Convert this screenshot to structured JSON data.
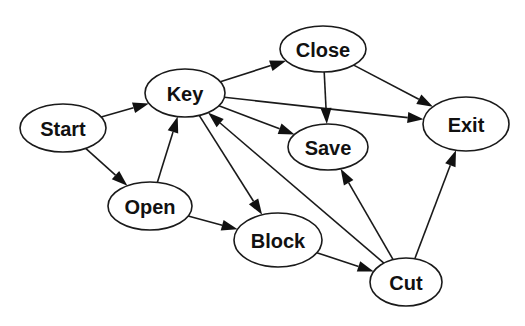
{
  "diagram": {
    "type": "directed-graph",
    "colors": {
      "background": "#ffffff",
      "stroke": "#1a1a1a",
      "text": "#111111"
    },
    "nodes": [
      {
        "id": "start",
        "label": "Start",
        "cx": 63,
        "cy": 128,
        "rx": 43,
        "ry": 24
      },
      {
        "id": "key",
        "label": "Key",
        "cx": 185,
        "cy": 93,
        "rx": 40,
        "ry": 24
      },
      {
        "id": "close",
        "label": "Close",
        "cx": 323,
        "cy": 49,
        "rx": 43,
        "ry": 23
      },
      {
        "id": "save",
        "label": "Save",
        "cx": 328,
        "cy": 147,
        "rx": 40,
        "ry": 23
      },
      {
        "id": "exit",
        "label": "Exit",
        "cx": 466,
        "cy": 124,
        "rx": 43,
        "ry": 27
      },
      {
        "id": "open",
        "label": "Open",
        "cx": 150,
        "cy": 206,
        "rx": 42,
        "ry": 24
      },
      {
        "id": "block",
        "label": "Block",
        "cx": 278,
        "cy": 240,
        "rx": 44,
        "ry": 27
      },
      {
        "id": "cut",
        "label": "Cut",
        "cx": 406,
        "cy": 282,
        "rx": 36,
        "ry": 24
      }
    ],
    "edges": [
      {
        "from": "start",
        "to": "key"
      },
      {
        "from": "start",
        "to": "open"
      },
      {
        "from": "open",
        "to": "key"
      },
      {
        "from": "open",
        "to": "block"
      },
      {
        "from": "key",
        "to": "close"
      },
      {
        "from": "key",
        "to": "save"
      },
      {
        "from": "key",
        "to": "exit"
      },
      {
        "from": "key",
        "to": "block"
      },
      {
        "from": "close",
        "to": "save"
      },
      {
        "from": "close",
        "to": "exit"
      },
      {
        "from": "block",
        "to": "cut"
      },
      {
        "from": "cut",
        "to": "key"
      },
      {
        "from": "cut",
        "to": "save"
      },
      {
        "from": "cut",
        "to": "exit"
      }
    ]
  }
}
